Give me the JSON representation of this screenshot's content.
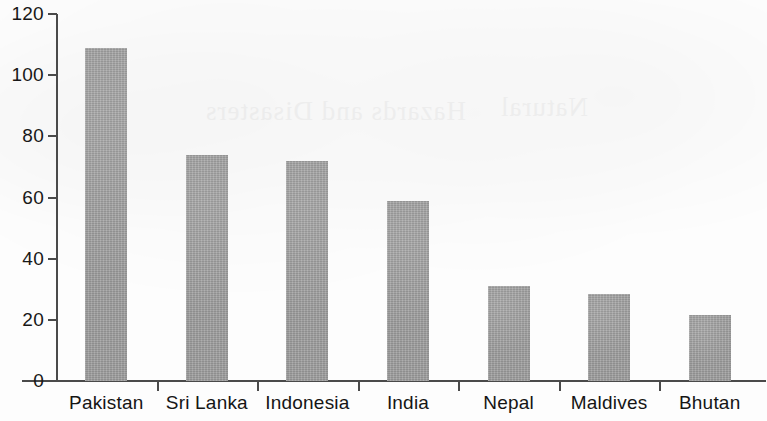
{
  "chart_data": {
    "type": "bar",
    "title": "",
    "subtitle": "",
    "xlabel": "",
    "ylabel": "",
    "categories": [
      "Pakistan",
      "Sri Lanka",
      "Indonesia",
      "India",
      "Nepal",
      "Maldives",
      "Bhutan"
    ],
    "values": [
      109,
      74,
      72,
      59,
      31,
      28.5,
      21.5
    ],
    "series": [
      {
        "name": "",
        "values": [
          109,
          74,
          72,
          59,
          31,
          28.5,
          21.5
        ]
      }
    ],
    "ylim": [
      0,
      120
    ],
    "ytick_labels": [
      "0",
      "20",
      "40",
      "60",
      "80",
      "100",
      "120"
    ],
    "ytick_values": [
      0,
      20,
      40,
      60,
      80,
      100,
      120
    ],
    "grid": false,
    "legend": null,
    "legend_position": "none",
    "bar_color": "#9c9c9c",
    "axis_color": "#4a4a4a",
    "text_color": "#151515",
    "background_color": "#ffffff",
    "annotations": []
  },
  "figure": {
    "bleed_through_text": [
      "Hazards and Disasters",
      "Natural"
    ]
  }
}
